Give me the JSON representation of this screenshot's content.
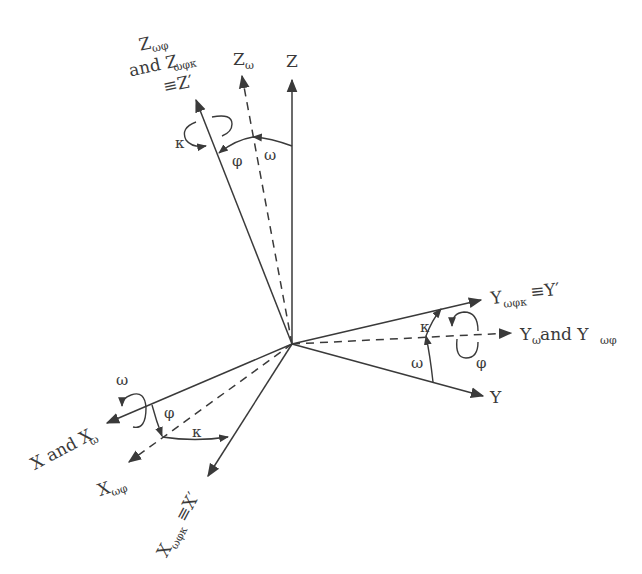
{
  "diagram": {
    "type": "coordinate-axes-rotation",
    "origin": {
      "x": 292,
      "y": 344
    },
    "axes": [
      {
        "id": "Z",
        "style": "solid",
        "tip": [
          292,
          78
        ],
        "label": "Z"
      },
      {
        "id": "Z_omega",
        "style": "dashed",
        "tip": [
          241,
          73
        ],
        "label": "Z",
        "subscript": "ω"
      },
      {
        "id": "Z_prime",
        "style": "solid",
        "tip": [
          195,
          97
        ],
        "label_lines": [
          "Z",
          "and Z",
          "≡Z′"
        ],
        "subscripts": [
          "ωφ",
          "ωφκ"
        ]
      },
      {
        "id": "Y",
        "style": "solid",
        "tip": [
          485,
          396
        ],
        "label": "Y"
      },
      {
        "id": "Y_omega",
        "style": "dashed",
        "tip": [
          513,
          333
        ],
        "label": "Y",
        "subscript": "ω",
        "label_suffix": " and Y",
        "subscript2": "ωφ"
      },
      {
        "id": "Y_prime",
        "style": "solid",
        "tip": [
          483,
          299
        ],
        "label": "Y",
        "subscript": "ωφκ",
        "label_suffix": "≡Y′"
      },
      {
        "id": "X",
        "style": "solid",
        "tip": [
          105,
          424
        ],
        "label": "X and X",
        "subscript": "ω"
      },
      {
        "id": "X_omega_phi",
        "style": "dashed",
        "tip": [
          127,
          463
        ],
        "label": "X",
        "subscript": "ωφ"
      },
      {
        "id": "X_prime",
        "style": "solid",
        "tip": [
          207,
          478
        ],
        "label": "X",
        "subscript": "ωφκ",
        "label_suffix": "≡X′"
      }
    ],
    "angles": {
      "omega": "ω",
      "phi": "φ",
      "kappa": "κ"
    },
    "labels": {
      "Z": "Z",
      "Z_omega_main": "Z",
      "Z_omega_sub": "ω",
      "Zp_line1_main": "Z",
      "Zp_line1_sub": "ωφ",
      "Zp_line2_main": "and Z",
      "Zp_line2_sub": "ωφκ",
      "Zp_line3": "≡Z′",
      "Yp_main": "Y",
      "Yp_sub": "ωφκ",
      "Yp_suffix": "≡Y′",
      "Yw_main": "Y",
      "Yw_sub": "ω",
      "Yw_and": " and Y",
      "Yw_sub2": "ωφ",
      "Y": "Y",
      "X_main": "X and X",
      "X_sub": "ω",
      "Xwp_main": "X",
      "Xwp_sub": "ωφ",
      "Xp_main": "X",
      "Xp_sub": "ωφκ",
      "Xp_suffix": "≡X′",
      "omega": "ω",
      "phi": "φ",
      "kappa": "κ"
    }
  }
}
